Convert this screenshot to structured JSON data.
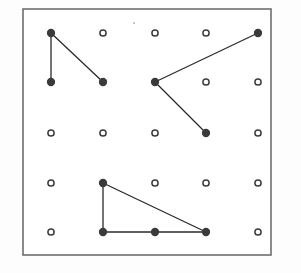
{
  "figure": {
    "background_color": "#fdfdfd",
    "board_fill": "#ffffff",
    "board_border_color": "#6e6e6e",
    "board_border_width": 1.6,
    "board_rect": {
      "x": 23,
      "y": 9,
      "width": 248,
      "height": 246
    }
  },
  "grid": {
    "rows": 5,
    "cols": 5,
    "x_positions": [
      51,
      103,
      155,
      206,
      258
    ],
    "y_positions": [
      33,
      82,
      133,
      183,
      232
    ],
    "pin_radius": 3.1,
    "pin_ring_width": 1.5,
    "pin_color": "#3c3c3c",
    "pin_fill": "#ffffff",
    "connected_pin_radius": 3.4,
    "connected_pin_fill": "#2b2b2b"
  },
  "pins": [
    {
      "id": "pin-r0-c0",
      "row": 0,
      "col": 0,
      "x": 51,
      "y": 33,
      "connected": true
    },
    {
      "id": "pin-r0-c1",
      "row": 0,
      "col": 1,
      "x": 103,
      "y": 33,
      "connected": false
    },
    {
      "id": "pin-r0-c2",
      "row": 0,
      "col": 2,
      "x": 155,
      "y": 33,
      "connected": false
    },
    {
      "id": "pin-r0-c3",
      "row": 0,
      "col": 3,
      "x": 206,
      "y": 33,
      "connected": false
    },
    {
      "id": "pin-r0-c4",
      "row": 0,
      "col": 4,
      "x": 258,
      "y": 33,
      "connected": true
    },
    {
      "id": "pin-r1-c0",
      "row": 1,
      "col": 0,
      "x": 51,
      "y": 82,
      "connected": true
    },
    {
      "id": "pin-r1-c1",
      "row": 1,
      "col": 1,
      "x": 103,
      "y": 82,
      "connected": true
    },
    {
      "id": "pin-r1-c2",
      "row": 1,
      "col": 2,
      "x": 155,
      "y": 82,
      "connected": true
    },
    {
      "id": "pin-r1-c3",
      "row": 1,
      "col": 3,
      "x": 206,
      "y": 82,
      "connected": false
    },
    {
      "id": "pin-r1-c4",
      "row": 1,
      "col": 4,
      "x": 258,
      "y": 82,
      "connected": false
    },
    {
      "id": "pin-r2-c0",
      "row": 2,
      "col": 0,
      "x": 51,
      "y": 133,
      "connected": false
    },
    {
      "id": "pin-r2-c1",
      "row": 2,
      "col": 1,
      "x": 103,
      "y": 133,
      "connected": false
    },
    {
      "id": "pin-r2-c2",
      "row": 2,
      "col": 2,
      "x": 155,
      "y": 133,
      "connected": false
    },
    {
      "id": "pin-r2-c3",
      "row": 2,
      "col": 3,
      "x": 206,
      "y": 133,
      "connected": true
    },
    {
      "id": "pin-r2-c4",
      "row": 2,
      "col": 4,
      "x": 258,
      "y": 133,
      "connected": false
    },
    {
      "id": "pin-r3-c0",
      "row": 3,
      "col": 0,
      "x": 51,
      "y": 183,
      "connected": false
    },
    {
      "id": "pin-r3-c1",
      "row": 3,
      "col": 1,
      "x": 103,
      "y": 183,
      "connected": true
    },
    {
      "id": "pin-r3-c2",
      "row": 3,
      "col": 2,
      "x": 155,
      "y": 183,
      "connected": false
    },
    {
      "id": "pin-r3-c3",
      "row": 3,
      "col": 3,
      "x": 206,
      "y": 183,
      "connected": false
    },
    {
      "id": "pin-r3-c4",
      "row": 3,
      "col": 4,
      "x": 258,
      "y": 183,
      "connected": false
    },
    {
      "id": "pin-r4-c0",
      "row": 4,
      "col": 0,
      "x": 51,
      "y": 232,
      "connected": false
    },
    {
      "id": "pin-r4-c1",
      "row": 4,
      "col": 1,
      "x": 103,
      "y": 232,
      "connected": true
    },
    {
      "id": "pin-r4-c2",
      "row": 4,
      "col": 2,
      "x": 155,
      "y": 232,
      "connected": true
    },
    {
      "id": "pin-r4-c3",
      "row": 4,
      "col": 3,
      "x": 206,
      "y": 232,
      "connected": true
    },
    {
      "id": "pin-r4-c4",
      "row": 4,
      "col": 4,
      "x": 258,
      "y": 232,
      "connected": false
    }
  ],
  "shapes": [
    {
      "id": "shape-top-left-angle",
      "label": "Top-left open angle",
      "stroke_color": "#2b2b2b",
      "stroke_width": 1.3,
      "closed": false,
      "vertices": [
        {
          "x": 51,
          "y": 82
        },
        {
          "x": 51,
          "y": 33
        },
        {
          "x": 103,
          "y": 82
        }
      ]
    },
    {
      "id": "shape-middle-v",
      "label": "Middle open V angle",
      "stroke_color": "#2b2b2b",
      "stroke_width": 1.3,
      "closed": false,
      "vertices": [
        {
          "x": 258,
          "y": 33
        },
        {
          "x": 155,
          "y": 82
        },
        {
          "x": 206,
          "y": 133
        }
      ]
    },
    {
      "id": "shape-bottom-triangle",
      "label": "Bottom right triangle",
      "stroke_color": "#2b2b2b",
      "stroke_width": 1.3,
      "closed": true,
      "vertices": [
        {
          "x": 103,
          "y": 183
        },
        {
          "x": 206,
          "y": 232
        },
        {
          "x": 103,
          "y": 232
        }
      ]
    }
  ],
  "artifacts": [
    {
      "id": "scan-speck",
      "x": 134,
      "y": 23,
      "radius": 1.1
    }
  ]
}
